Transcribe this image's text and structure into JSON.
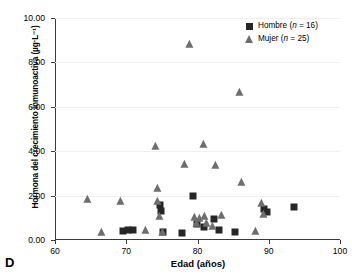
{
  "panel": {
    "label": "D"
  },
  "chart_data": {
    "type": "scatter",
    "title": "",
    "xlabel": "Edad (años)",
    "ylabel": "Hormona del crecimiento inmunoactiva (µg·L⁻¹)",
    "xlim": [
      60,
      100
    ],
    "ylim": [
      0.0,
      10.0
    ],
    "xticks": [
      60,
      70,
      80,
      90,
      100
    ],
    "xtick_labels": [
      "60",
      "70",
      "80",
      "90",
      "100"
    ],
    "yticks": [
      0.0,
      2.0,
      4.0,
      6.0,
      8.0,
      10.0
    ],
    "ytick_labels": [
      "0.00",
      "2.00",
      "4.00",
      "6.00",
      "8.00",
      "10.00"
    ],
    "grid": "horizontal",
    "legend_position": "top-right",
    "series": [
      {
        "name": "Hombre",
        "n": 16,
        "legend_label": "Hombre (n = 16)",
        "marker": "square",
        "color": "#262626",
        "points": [
          [
            69.6,
            0.42
          ],
          [
            70.3,
            0.45
          ],
          [
            70.9,
            0.47
          ],
          [
            74.8,
            1.58
          ],
          [
            74.9,
            1.3
          ],
          [
            75.1,
            0.38
          ],
          [
            77.8,
            0.3
          ],
          [
            79.4,
            2.0
          ],
          [
            79.9,
            0.72
          ],
          [
            80.9,
            0.6
          ],
          [
            82.3,
            0.95
          ],
          [
            83.0,
            0.44
          ],
          [
            85.3,
            0.38
          ],
          [
            89.3,
            1.4
          ],
          [
            89.8,
            1.25
          ],
          [
            93.6,
            1.5
          ]
        ]
      },
      {
        "name": "Mujer",
        "n": 25,
        "legend_label": "Mujer (n = 25)",
        "marker": "triangle",
        "color": "#6e6e6e",
        "points": [
          [
            64.6,
            1.78
          ],
          [
            66.6,
            0.32
          ],
          [
            69.2,
            1.72
          ],
          [
            72.8,
            0.42
          ],
          [
            74.2,
            4.18
          ],
          [
            74.4,
            2.3
          ],
          [
            74.5,
            1.72
          ],
          [
            74.7,
            1.05
          ],
          [
            75.1,
            0.3
          ],
          [
            78.2,
            3.38
          ],
          [
            79.0,
            8.78
          ],
          [
            79.6,
            1.0
          ],
          [
            79.9,
            0.7
          ],
          [
            80.3,
            0.95
          ],
          [
            80.9,
            4.3
          ],
          [
            81.0,
            1.05
          ],
          [
            81.3,
            0.72
          ],
          [
            82.2,
            0.58
          ],
          [
            82.6,
            3.32
          ],
          [
            83.4,
            1.1
          ],
          [
            85.9,
            6.62
          ],
          [
            86.2,
            2.58
          ],
          [
            88.2,
            0.38
          ],
          [
            89.1,
            1.6
          ],
          [
            89.4,
            1.12
          ]
        ]
      }
    ]
  }
}
